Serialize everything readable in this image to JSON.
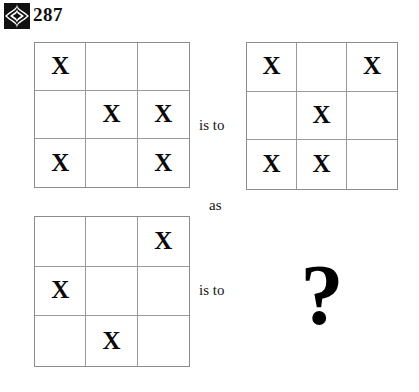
{
  "header": {
    "ornament_icon": "star-diamond-ornament-icon",
    "page_number": "287"
  },
  "puzzle": {
    "type": "visual-analogy",
    "mark_symbol": "X",
    "connectors": {
      "first": "is to",
      "middle": "as",
      "second": "is to"
    },
    "answer_placeholder": "?",
    "grids": [
      {
        "id": "grid-a",
        "role": "analogy-term-1",
        "rows": [
          [
            "X",
            "",
            ""
          ],
          [
            "",
            "X",
            "X"
          ],
          [
            "X",
            "",
            "X"
          ]
        ]
      },
      {
        "id": "grid-b",
        "role": "analogy-term-2",
        "rows": [
          [
            "X",
            "",
            "X"
          ],
          [
            "",
            "X",
            ""
          ],
          [
            "X",
            "X",
            ""
          ]
        ]
      },
      {
        "id": "grid-c",
        "role": "analogy-term-3",
        "rows": [
          [
            "",
            "",
            "X"
          ],
          [
            "X",
            "",
            ""
          ],
          [
            "",
            "X",
            ""
          ]
        ]
      }
    ]
  },
  "colors": {
    "background": "#ffffff",
    "ink": "#0a0a0a",
    "grid_line": "#9a9a9a",
    "grid_border": "#8c8c8c"
  }
}
